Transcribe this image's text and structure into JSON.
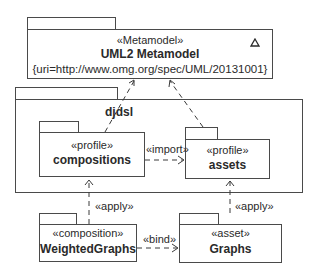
{
  "metamodel": {
    "stereotype": "«Metamodel»",
    "name": "UML2 Metamodel",
    "uri": "{uri=http://www.omg.org/spec/UML/20131001}",
    "icon": "triangle-icon"
  },
  "djdsl": {
    "name": "djdsl"
  },
  "compositions": {
    "stereotype": "«profile»",
    "name": "compositions"
  },
  "assets": {
    "stereotype": "«profile»",
    "name": "assets"
  },
  "weighted_graphs": {
    "stereotype": "«composition»",
    "name": "WeightedGraphs"
  },
  "graphs": {
    "stereotype": "«asset»",
    "name": "Graphs"
  },
  "relations": {
    "import_label": "«import»",
    "apply_left_label": "«apply»",
    "apply_right_label": "«apply»",
    "bind_label": "«bind»"
  }
}
